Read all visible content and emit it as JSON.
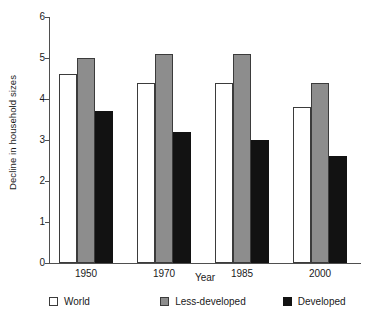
{
  "chart_data": {
    "type": "bar",
    "title": "",
    "xlabel": "Year",
    "ylabel": "Decline in household sizes",
    "categories": [
      "1950",
      "1970",
      "1985",
      "2000"
    ],
    "ylim": [
      0,
      6
    ],
    "yticks": [
      "0",
      "1",
      "2",
      "3",
      "4",
      "5",
      "6"
    ],
    "grid": false,
    "legend_position": "bottom",
    "series": [
      {
        "name": "World",
        "color": "#ffffff",
        "values": [
          4.6,
          4.4,
          4.4,
          3.8
        ]
      },
      {
        "name": "Less-developed",
        "color": "#8d8d8d",
        "values": [
          5.0,
          5.1,
          5.1,
          4.4
        ]
      },
      {
        "name": "Developed",
        "color": "#121212",
        "values": [
          3.7,
          3.2,
          3.0,
          2.6
        ]
      }
    ]
  }
}
